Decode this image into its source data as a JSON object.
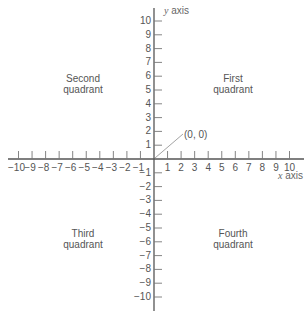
{
  "diagram": {
    "type": "cartesian-coordinate-plane",
    "x_axis": {
      "label_var": "x",
      "label_word": "axis",
      "min": -10,
      "max": 10,
      "tick_labels": [
        "-10",
        "-9",
        "-8",
        "-7",
        "-6",
        "-5",
        "-4",
        "-3",
        "-2",
        "-1",
        "1",
        "2",
        "3",
        "4",
        "5",
        "6",
        "7",
        "8",
        "9",
        "10"
      ]
    },
    "y_axis": {
      "label_var": "y",
      "label_word": "axis",
      "min": -10,
      "max": 10,
      "tick_labels": [
        "10",
        "9",
        "8",
        "7",
        "6",
        "5",
        "4",
        "3",
        "2",
        "1",
        "-1",
        "-2",
        "-3",
        "-4",
        "-5",
        "-6",
        "-7",
        "-8",
        "-9",
        "-10"
      ]
    },
    "origin_label": "(0, 0)",
    "quadrants": {
      "first": {
        "line1": "First",
        "line2": "quadrant"
      },
      "second": {
        "line1": "Second",
        "line2": "quadrant"
      },
      "third": {
        "line1": "Third",
        "line2": "quadrant"
      },
      "fourth": {
        "line1": "Fourth",
        "line2": "quadrant"
      }
    },
    "colors": {
      "axis": "#555555",
      "text": "#555555",
      "pointer": "#999999"
    }
  }
}
